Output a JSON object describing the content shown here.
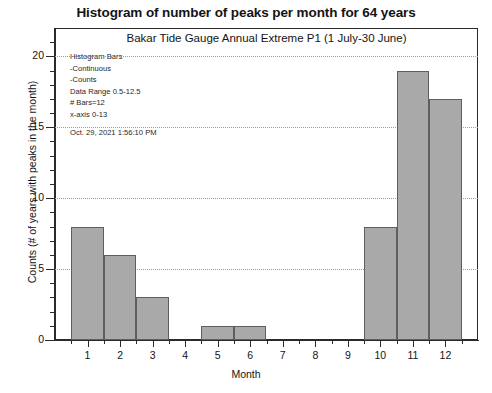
{
  "chart_data": {
    "type": "bar",
    "title": "Histogram of number of peaks per month for 64 years",
    "subtitle": "Bakar Tide Gauge Annual Extreme P1 (1 July-30 June)",
    "xlabel": "Month",
    "ylabel": "Counts (# of years with peaks in the month)",
    "categories": [
      "1",
      "2",
      "3",
      "4",
      "5",
      "6",
      "7",
      "8",
      "9",
      "10",
      "11",
      "12"
    ],
    "values": [
      8,
      6,
      3,
      0,
      1,
      1,
      0,
      0,
      0,
      8,
      19,
      17
    ],
    "xlim": [
      0,
      13
    ],
    "ylim": [
      0,
      22
    ],
    "yticks": [
      "0",
      "5",
      "10",
      "15",
      "20"
    ],
    "ytick_values": [
      0,
      5,
      10,
      15,
      20
    ],
    "xticks": [
      "1",
      "2",
      "3",
      "4",
      "5",
      "6",
      "7",
      "8",
      "9",
      "10",
      "11",
      "12"
    ],
    "grid": true,
    "legend": "none",
    "bar_color": "#a9a9a9",
    "bar_edge_color": "#5e5e5e",
    "bin_edges": [
      0.5,
      1.5,
      2.5,
      3.5,
      4.5,
      5.5,
      6.5,
      7.5,
      8.5,
      9.5,
      10.5,
      11.5,
      12.5
    ]
  },
  "annotation": {
    "line1": "Histogram Bars",
    "line2": "-Continuous",
    "line3": "-Counts",
    "line4": "Data Range 0.5-12.5",
    "line5": "# Bars=12",
    "line6": "x-axis 0-13",
    "timestamp": "Oct. 29, 2021  1:56:10 PM"
  }
}
